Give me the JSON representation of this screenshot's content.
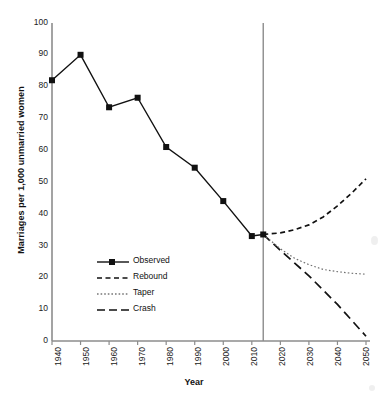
{
  "chart_data": {
    "type": "line",
    "title": "",
    "xlabel": "Year",
    "ylabel": "Marriages per 1,000 unmarried women",
    "xlim": [
      1940,
      2050
    ],
    "ylim": [
      0,
      100
    ],
    "xticks": [
      1940,
      1950,
      1960,
      1970,
      1980,
      1990,
      2000,
      2010,
      2020,
      2030,
      2040,
      2050
    ],
    "yticks": [
      0,
      10,
      20,
      30,
      40,
      50,
      60,
      70,
      80,
      90,
      100
    ],
    "grid": false,
    "legend_position": "center-left-inside",
    "reference_line_x": 2014,
    "series": [
      {
        "name": "Observed",
        "style": "solid",
        "marker": "square",
        "x": [
          1940,
          1950,
          1960,
          1970,
          1980,
          1990,
          2000,
          2010,
          2014
        ],
        "values": [
          82,
          90,
          73.5,
          76.5,
          61,
          54.5,
          44,
          33,
          33.5
        ]
      },
      {
        "name": "Rebound",
        "style": "dashed",
        "marker": "none",
        "x": [
          2014,
          2020,
          2025,
          2030,
          2035,
          2040,
          2045,
          2050
        ],
        "values": [
          33.5,
          34,
          35,
          36.5,
          39,
          42.5,
          46.5,
          51
        ]
      },
      {
        "name": "Taper",
        "style": "dotted",
        "marker": "none",
        "x": [
          2014,
          2020,
          2025,
          2030,
          2035,
          2040,
          2045,
          2050
        ],
        "values": [
          33.5,
          29,
          26,
          24,
          22.5,
          21.8,
          21.3,
          21
        ]
      },
      {
        "name": "Crash",
        "style": "longdash",
        "marker": "none",
        "x": [
          2014,
          2020,
          2025,
          2030,
          2035,
          2040,
          2045,
          2050
        ],
        "values": [
          33.5,
          28.5,
          24.5,
          20.5,
          16,
          11.5,
          6.5,
          1.5
        ]
      }
    ]
  },
  "legend": {
    "items": [
      {
        "label": "Observed",
        "style": "solid-marker"
      },
      {
        "label": "Rebound",
        "style": "dashed"
      },
      {
        "label": "Taper",
        "style": "dotted"
      },
      {
        "label": "Crash",
        "style": "longdash"
      }
    ]
  },
  "axes": {
    "x_title": "Year",
    "y_title": "Marriages per 1,000 unmarried women",
    "y_tick_labels": [
      "100",
      "90",
      "80",
      "70",
      "60",
      "50",
      "40",
      "30",
      "20",
      "10",
      "0"
    ],
    "x_tick_labels": [
      "1940",
      "1950",
      "1960",
      "1970",
      "1980",
      "1990",
      "2000",
      "2010",
      "2020",
      "2030",
      "2040",
      "2050"
    ]
  },
  "colors": {
    "axis": "#8c8c8c",
    "series": "#111111",
    "taper": "#6e6e6e",
    "background": "#ffffff"
  }
}
